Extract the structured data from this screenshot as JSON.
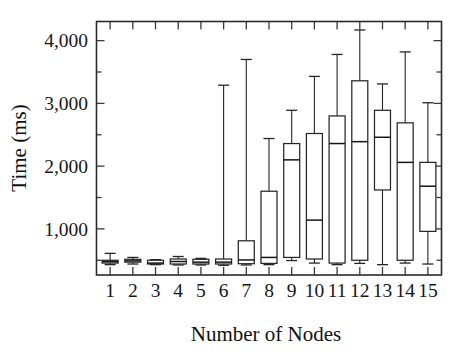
{
  "chart_data": {
    "type": "box",
    "title": "",
    "xlabel": "Number of Nodes",
    "ylabel": "Time (ms)",
    "xlim": [
      0.4,
      15.6
    ],
    "ylim": [
      265,
      4305
    ],
    "yticks": [
      1000,
      2000,
      3000,
      4000
    ],
    "ytick_labels": [
      "1,000",
      "2,000",
      "3,000",
      "4,000"
    ],
    "grid": false,
    "legend": null,
    "categories": [
      "1",
      "2",
      "3",
      "4",
      "5",
      "6",
      "7",
      "8",
      "9",
      "10",
      "11",
      "12",
      "13",
      "14",
      "15"
    ],
    "boxes": [
      {
        "category": "1",
        "whisker_low": 430,
        "q1": 455,
        "median": 478,
        "q3": 500,
        "whisker_high": 610
      },
      {
        "category": "2",
        "whisker_low": 440,
        "q1": 470,
        "median": 490,
        "q3": 515,
        "whisker_high": 545
      },
      {
        "category": "3",
        "whisker_low": 430,
        "q1": 440,
        "median": 455,
        "q3": 500,
        "whisker_high": 510
      },
      {
        "category": "4",
        "whisker_low": 425,
        "q1": 440,
        "median": 480,
        "q3": 520,
        "whisker_high": 560
      },
      {
        "category": "5",
        "whisker_low": 425,
        "q1": 440,
        "median": 470,
        "q3": 515,
        "whisker_high": 530
      },
      {
        "category": "6",
        "whisker_low": 420,
        "q1": 440,
        "median": 470,
        "q3": 520,
        "whisker_high": 3290
      },
      {
        "category": "7",
        "whisker_low": 425,
        "q1": 445,
        "median": 505,
        "q3": 810,
        "whisker_high": 3700
      },
      {
        "category": "8",
        "whisker_low": 430,
        "q1": 450,
        "median": 545,
        "q3": 1600,
        "whisker_high": 2440
      },
      {
        "category": "9",
        "whisker_low": 495,
        "q1": 545,
        "median": 2100,
        "q3": 2360,
        "whisker_high": 2890
      },
      {
        "category": "10",
        "whisker_low": 455,
        "q1": 520,
        "median": 1140,
        "q3": 2520,
        "whisker_high": 3430
      },
      {
        "category": "11",
        "whisker_low": 430,
        "q1": 455,
        "median": 2360,
        "q3": 2800,
        "whisker_high": 3780
      },
      {
        "category": "12",
        "whisker_low": 450,
        "q1": 500,
        "median": 2390,
        "q3": 3360,
        "whisker_high": 4170
      },
      {
        "category": "13",
        "whisker_low": 430,
        "q1": 1620,
        "median": 2460,
        "q3": 2890,
        "whisker_high": 3310
      },
      {
        "category": "14",
        "whisker_low": 455,
        "q1": 500,
        "median": 2060,
        "q3": 2690,
        "whisker_high": 3820
      },
      {
        "category": "15",
        "whisker_low": 440,
        "q1": 960,
        "median": 1680,
        "q3": 2060,
        "whisker_high": 3010
      }
    ],
    "colors": {
      "line": "#262626",
      "fill": "#ffffff",
      "axis": "#2b2b2b"
    }
  }
}
